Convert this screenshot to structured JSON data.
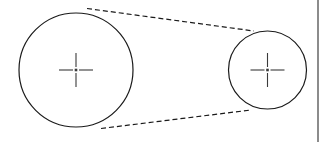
{
  "figure": {
    "name": "two-pulley-belt-drive-diagram",
    "width": 325,
    "height": 142,
    "background_color": "#ffffff",
    "stroke_color": "#1a1a1a",
    "centerline_color": "#3a3a3a",
    "border_color": "#8c8c8c"
  },
  "chart_data": {
    "type": "diagram",
    "title": "",
    "subtitle": "",
    "xlabel": "",
    "ylabel": "",
    "legend": [],
    "annotations": [],
    "elements": [
      {
        "id": "large-pulley",
        "kind": "circle",
        "label": "",
        "cx": 76,
        "cy": 70,
        "r": 57,
        "stroke": "#1a1a1a",
        "stroke_width": 1.2,
        "fill": "none",
        "line_style": "solid"
      },
      {
        "id": "small-pulley",
        "kind": "circle",
        "label": "",
        "cx": 267.5,
        "cy": 70,
        "r": 39,
        "stroke": "#1a1a1a",
        "stroke_width": 1.2,
        "fill": "none",
        "line_style": "solid"
      },
      {
        "id": "belt-upper-tangent",
        "kind": "line",
        "label": "",
        "x1": 87,
        "y1": 8.5,
        "x2": 254,
        "y2": 31,
        "stroke": "#1a1a1a",
        "stroke_width": 1.2,
        "line_style": "dashed",
        "dash_pattern": "5 3"
      },
      {
        "id": "belt-lower-tangent",
        "kind": "line",
        "label": "",
        "x1": 101,
        "y1": 128.5,
        "x2": 251,
        "y2": 110,
        "stroke": "#1a1a1a",
        "stroke_width": 1.2,
        "line_style": "dashed",
        "dash_pattern": "5 3"
      },
      {
        "id": "large-pulley-centermark",
        "kind": "centermark",
        "label": "",
        "cx": 76,
        "cy": 70,
        "arm_length": 17,
        "center_gap": 3,
        "stroke": "#3a3a3a",
        "stroke_width": 1.1
      },
      {
        "id": "small-pulley-centermark",
        "kind": "centermark",
        "label": "",
        "cx": 267.5,
        "cy": 70,
        "arm_length": 17,
        "center_gap": 3,
        "stroke": "#3a3a3a",
        "stroke_width": 1.1
      },
      {
        "id": "right-edge-rule",
        "kind": "rule",
        "label": "",
        "x": 317,
        "y": 0,
        "width": 2,
        "height": 142,
        "fill": "#8c8c8c"
      }
    ]
  }
}
